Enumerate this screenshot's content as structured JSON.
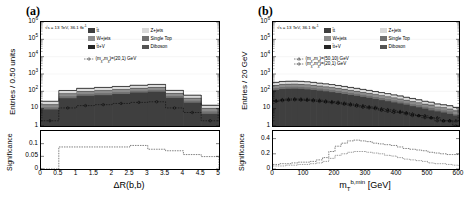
{
  "figure": {
    "panel_a_label": "(a)",
    "panel_b_label": "(b)"
  },
  "colors": {
    "ttbar": "#3f3f3f",
    "wjets": "#8c8c8c",
    "ttv": "#262626",
    "zjets": "#d9d9d9",
    "singletop": "#707070",
    "diboson": "#545454",
    "signal_line": "#000000",
    "axis": "#000000",
    "background": "#ffffff"
  },
  "panel_a": {
    "label": "(a)",
    "lumi_text": "√s = 13 TeV, 36.1 fb",
    "lumi_sup": "-1",
    "y_title": "Entries / 0.50 units",
    "x_title": "ΔR(b,b)",
    "y_ticks": [
      "10",
      "10",
      "10",
      "10",
      "10",
      "10",
      "1"
    ],
    "y_tick_sups": [
      "6",
      "5",
      "4",
      "3",
      "2",
      "",
      ""
    ],
    "x_ticks": [
      "0",
      "0.5",
      "1",
      "1.5",
      "2",
      "2.5",
      "3",
      "3.5",
      "4",
      "4.5",
      "5"
    ],
    "ratio_y_title": "Significance",
    "ratio_y_ticks": [
      "0.1",
      "0.05",
      "0"
    ],
    "legend": [
      {
        "label": "t̄t",
        "color_key": "ttbar",
        "col": 0,
        "row": 0
      },
      {
        "label": "W+jets",
        "color_key": "wjets",
        "col": 0,
        "row": 1
      },
      {
        "label": "t̄t+V",
        "color_key": "ttv",
        "col": 0,
        "row": 2
      },
      {
        "label": "Z+jets",
        "color_key": "zjets",
        "col": 1,
        "row": 0
      },
      {
        "label": "Single Top",
        "color_key": "singletop",
        "col": 1,
        "row": 1
      },
      {
        "label": "Diboson",
        "color_key": "diboson",
        "col": 1,
        "row": 2
      }
    ],
    "signal_legend": [
      {
        "label_pre": "(m",
        "sub1": "χ̃",
        "mid": ",m",
        "sub2": "χ̃",
        "post": ")=(20,1) GeV",
        "marker": "open-circle-dashed"
      }
    ]
  },
  "panel_b": {
    "label": "(b)",
    "lumi_text": "√s = 13 TeV, 36.1 fb",
    "lumi_sup": "-1",
    "y_title": "Entries / 20 GeV",
    "x_title_pre": "m",
    "x_title_sub": "T",
    "x_title_sup": "b,min",
    "x_title_unit": " [GeV]",
    "y_ticks": [
      "10",
      "10",
      "10",
      "10",
      "10",
      "10",
      "1"
    ],
    "y_tick_sups": [
      "6",
      "5",
      "4",
      "3",
      "2",
      "",
      ""
    ],
    "x_ticks": [
      "0",
      "100",
      "200",
      "300",
      "400",
      "500",
      "600"
    ],
    "ratio_y_title": "Significance",
    "ratio_y_ticks": [
      "0.4",
      "0.2",
      "0"
    ],
    "legend": [
      {
        "label": "t̄t",
        "color_key": "ttbar",
        "col": 0,
        "row": 0
      },
      {
        "label": "W+jets",
        "color_key": "wjets",
        "col": 0,
        "row": 1
      },
      {
        "label": "t̄t+V",
        "color_key": "ttv",
        "col": 0,
        "row": 2
      },
      {
        "label": "Z+jets",
        "color_key": "zjets",
        "col": 1,
        "row": 0
      },
      {
        "label": "Single Top",
        "color_key": "singletop",
        "col": 1,
        "row": 1
      },
      {
        "label": "Diboson",
        "color_key": "diboson",
        "col": 1,
        "row": 2
      }
    ],
    "signal_legend": [
      {
        "label_pre": "(m",
        "sub1": "χ̃",
        "mid": ",m",
        "sub2": "χ̃",
        "post": ")=(50,10) GeV",
        "marker": "open-triangle-dashed"
      },
      {
        "label_pre": "(m",
        "sub1": "χ̃",
        "mid": ",m",
        "sub2": "χ̃",
        "post": ")=(20,1) GeV",
        "marker": "open-circle-dashed"
      }
    ]
  },
  "chart_data": [
    {
      "id": "panel-a-main",
      "type": "bar",
      "title": "(a)",
      "stacked": true,
      "xlabel": "ΔR(b,b)",
      "ylabel": "Entries / 0.50 units",
      "yscale": "log",
      "ylim": [
        1,
        1000000
      ],
      "xlim": [
        0,
        5
      ],
      "bin_edges": [
        0,
        0.5,
        1.0,
        1.5,
        2.0,
        2.5,
        3.0,
        3.5,
        4.0,
        4.5,
        5.0
      ],
      "categories": [
        "0-0.5",
        "0.5-1",
        "1-1.5",
        "1.5-2",
        "2-2.5",
        "2.5-3",
        "3-3.5",
        "3.5-4",
        "4-4.5",
        "4.5-5"
      ],
      "series": [
        {
          "name": "t̄t",
          "color": "#3f3f3f",
          "values": [
            9,
            40,
            55,
            60,
            70,
            85,
            95,
            42,
            22,
            5
          ]
        },
        {
          "name": "Single Top",
          "color": "#707070",
          "values": [
            3,
            12,
            16,
            18,
            20,
            24,
            26,
            12,
            7,
            2
          ]
        },
        {
          "name": "W+jets",
          "color": "#8c8c8c",
          "values": [
            4,
            17,
            22,
            26,
            30,
            34,
            38,
            17,
            9,
            3
          ]
        },
        {
          "name": "Diboson",
          "color": "#545454",
          "values": [
            2,
            8,
            10,
            12,
            13,
            15,
            17,
            8,
            4,
            1
          ]
        },
        {
          "name": "Z+jets",
          "color": "#d9d9d9",
          "values": [
            8,
            30,
            40,
            45,
            50,
            58,
            64,
            30,
            16,
            4
          ]
        },
        {
          "name": "t̄t+V",
          "color": "#262626",
          "values": [
            1,
            5,
            7,
            8,
            9,
            10,
            11,
            5,
            3,
            1
          ]
        }
      ],
      "signal": [
        {
          "name": "(mχ̃,mχ̃)=(20,1) GeV",
          "style": "dashed-open-circle",
          "values": [
            2,
            11,
            15,
            17,
            20,
            23,
            25,
            11,
            6,
            2
          ]
        }
      ]
    },
    {
      "id": "panel-a-significance",
      "type": "line",
      "xlabel": "ΔR(b,b)",
      "ylabel": "Significance",
      "ylim": [
        0,
        0.15
      ],
      "xlim": [
        0,
        5
      ],
      "yticks": [
        0,
        0.05,
        0.1
      ],
      "x": [
        0,
        0.5,
        1.0,
        1.5,
        2.0,
        2.5,
        3.0,
        3.5,
        4.0,
        4.5,
        5.0
      ],
      "values": [
        0.0,
        0.087,
        0.087,
        0.087,
        0.087,
        0.093,
        0.078,
        0.072,
        0.057,
        0.049,
        0.0
      ]
    },
    {
      "id": "panel-b-main",
      "type": "bar",
      "title": "(b)",
      "stacked": true,
      "xlabel": "m_T^{b,min} [GeV]",
      "ylabel": "Entries / 20 GeV",
      "yscale": "log",
      "ylim": [
        1,
        1000000
      ],
      "xlim": [
        0,
        600
      ],
      "bin_width": 20,
      "categories": [
        "0",
        "20",
        "40",
        "60",
        "80",
        "100",
        "120",
        "140",
        "160",
        "180",
        "200",
        "220",
        "240",
        "260",
        "280",
        "300",
        "320",
        "340",
        "360",
        "380",
        "400",
        "420",
        "440",
        "460",
        "480",
        "500",
        "520",
        "540",
        "560",
        "580"
      ],
      "series": [
        {
          "name": "t̄t",
          "color": "#3f3f3f",
          "values": [
            120,
            135,
            140,
            142,
            138,
            130,
            120,
            110,
            100,
            90,
            80,
            70,
            62,
            55,
            48,
            42,
            36,
            31,
            27,
            23,
            20,
            17,
            14,
            12,
            10,
            8,
            7,
            6,
            5,
            4
          ]
        },
        {
          "name": "Single Top",
          "color": "#707070",
          "values": [
            38,
            42,
            44,
            44,
            43,
            41,
            38,
            34,
            31,
            28,
            25,
            22,
            19,
            17,
            15,
            13,
            11,
            10,
            8,
            7,
            6,
            5,
            4,
            4,
            3,
            3,
            2,
            2,
            2,
            1
          ]
        },
        {
          "name": "W+jets",
          "color": "#8c8c8c",
          "values": [
            52,
            58,
            60,
            61,
            59,
            56,
            52,
            47,
            42,
            38,
            34,
            30,
            26,
            23,
            20,
            18,
            15,
            13,
            11,
            10,
            8,
            7,
            6,
            5,
            4,
            4,
            3,
            3,
            2,
            2
          ]
        },
        {
          "name": "Diboson",
          "color": "#545454",
          "values": [
            22,
            25,
            26,
            26,
            25,
            24,
            22,
            20,
            18,
            16,
            14,
            13,
            11,
            10,
            8,
            7,
            6,
            5,
            5,
            4,
            4,
            3,
            3,
            2,
            2,
            2,
            1,
            1,
            1,
            1
          ]
        },
        {
          "name": "Z+jets",
          "color": "#d9d9d9",
          "values": [
            85,
            95,
            98,
            99,
            96,
            91,
            84,
            76,
            69,
            62,
            55,
            49,
            43,
            38,
            33,
            29,
            25,
            22,
            19,
            16,
            14,
            12,
            10,
            8,
            7,
            6,
            5,
            4,
            4,
            3
          ]
        },
        {
          "name": "t̄t+V",
          "color": "#262626",
          "values": [
            16,
            18,
            19,
            19,
            18,
            17,
            16,
            14,
            13,
            12,
            10,
            9,
            8,
            7,
            6,
            5,
            5,
            4,
            4,
            3,
            3,
            2,
            2,
            2,
            1,
            1,
            1,
            1,
            1,
            1
          ]
        }
      ],
      "signal": [
        {
          "name": "(mχ̃,mχ̃)=(50,10) GeV",
          "style": "dashed-open-triangle",
          "values": [
            30,
            34,
            36,
            37,
            36,
            35,
            33,
            31,
            28,
            26,
            24,
            21,
            19,
            17,
            15,
            13,
            12,
            10,
            9,
            8,
            7,
            6,
            5,
            4,
            4,
            3,
            3,
            2,
            2,
            2
          ]
        },
        {
          "name": "(mχ̃,mχ̃)=(20,1) GeV",
          "style": "dashed-open-circle",
          "values": [
            26,
            29,
            31,
            32,
            31,
            30,
            28,
            26,
            24,
            22,
            20,
            18,
            16,
            14,
            12,
            11,
            10,
            8,
            7,
            6,
            6,
            5,
            4,
            4,
            3,
            3,
            2,
            2,
            2,
            1
          ]
        }
      ]
    },
    {
      "id": "panel-b-significance",
      "type": "line",
      "xlabel": "m_T^{b,min} [GeV]",
      "ylabel": "Significance",
      "ylim": [
        0,
        0.5
      ],
      "xlim": [
        0,
        600
      ],
      "yticks": [
        0,
        0.2,
        0.4
      ],
      "series": [
        {
          "name": "(50,10) GeV",
          "x": [
            0,
            20,
            40,
            60,
            80,
            100,
            120,
            140,
            160,
            180,
            200,
            220,
            240,
            260,
            280,
            300,
            320,
            340,
            360,
            380,
            400,
            420,
            440,
            460,
            480,
            500,
            520,
            540,
            560,
            580,
            600
          ],
          "values": [
            0.06,
            0.07,
            0.07,
            0.08,
            0.09,
            0.09,
            0.1,
            0.12,
            0.15,
            0.23,
            0.3,
            0.34,
            0.37,
            0.38,
            0.37,
            0.36,
            0.34,
            0.33,
            0.32,
            0.31,
            0.29,
            0.27,
            0.26,
            0.25,
            0.24,
            0.22,
            0.21,
            0.2,
            0.19,
            0.19,
            0.2
          ]
        },
        {
          "name": "(20,1) GeV",
          "x": [
            0,
            20,
            40,
            60,
            80,
            100,
            120,
            140,
            160,
            180,
            200,
            220,
            240,
            260,
            280,
            300,
            320,
            340,
            360,
            380,
            400,
            420,
            440,
            460,
            480,
            500,
            520,
            540,
            560,
            580,
            600
          ],
          "values": [
            0.04,
            0.04,
            0.05,
            0.05,
            0.06,
            0.06,
            0.07,
            0.08,
            0.1,
            0.14,
            0.18,
            0.2,
            0.22,
            0.23,
            0.23,
            0.22,
            0.21,
            0.2,
            0.18,
            0.17,
            0.15,
            0.13,
            0.12,
            0.11,
            0.1,
            0.08,
            0.07,
            0.07,
            0.06,
            0.05,
            0.04
          ]
        }
      ]
    }
  ]
}
